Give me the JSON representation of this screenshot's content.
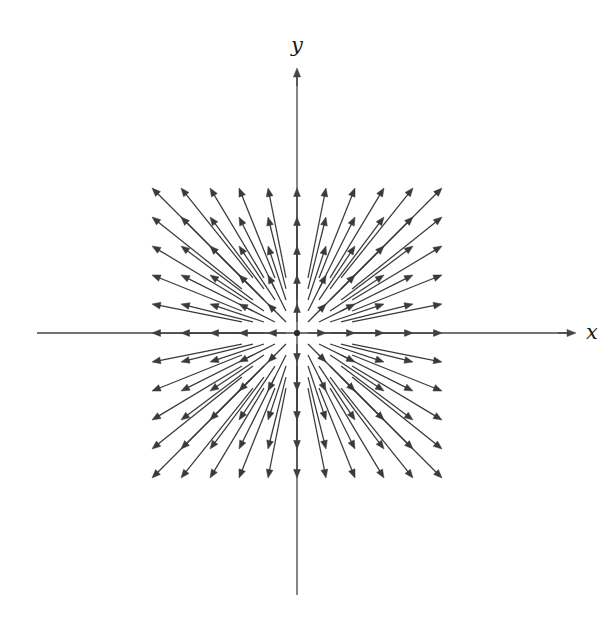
{
  "figure": {
    "width": 612,
    "height": 625,
    "background": "#ffffff",
    "title": ""
  },
  "axes": {
    "origin": {
      "x": 297,
      "y": 333
    },
    "color": "#444444",
    "line_width": 1.3,
    "x_axis": {
      "label": "x",
      "label_pos": {
        "x": 592,
        "y": 333
      },
      "start": {
        "x": 37,
        "y": 333
      },
      "end": {
        "x": 572,
        "y": 333
      },
      "arrow": "outward-right"
    },
    "y_axis": {
      "label": "y",
      "label_pos": {
        "x": 297,
        "y": 46
      },
      "start": {
        "x": 297,
        "y": 595
      },
      "end": {
        "x": 297,
        "y": 72
      },
      "arrow": "outward-up"
    }
  },
  "chart_data": {
    "type": "scatter",
    "plot_kind": "vector-field",
    "title": "",
    "xlabel": "x",
    "ylabel": "y",
    "grid": false,
    "legend": null,
    "xlim": [
      -5.8,
      5.8
    ],
    "ylim": [
      -5.8,
      5.8
    ],
    "field": {
      "name": "radial source field",
      "formula": "F(x, y) = ⟨x, y⟩",
      "direction": "radially outward from origin",
      "magnitude_rule": "proportional to distance from origin",
      "arrowhead_at": "lattice point",
      "tail_points_toward": "origin"
    },
    "lattice": {
      "i_min": -5,
      "i_max": 5,
      "j_min": -5,
      "j_max": 5,
      "count_x": 11,
      "count_y": 11,
      "spacing_px": 29,
      "total_arrows": 120,
      "origin_skipped": true
    },
    "arrow_style": {
      "color": "#3a3a3a",
      "line_width": 1.25,
      "head_length_px": 8.5,
      "head_half_width_px": 3.4,
      "scale_factor": 0.62
    },
    "sample_points": [
      {
        "x": 1,
        "y": 0,
        "u": 1,
        "v": 0
      },
      {
        "x": 5,
        "y": 0,
        "u": 5,
        "v": 0
      },
      {
        "x": -5,
        "y": 0,
        "u": -5,
        "v": 0
      },
      {
        "x": 0,
        "y": 5,
        "u": 0,
        "v": 5
      },
      {
        "x": 0,
        "y": -5,
        "u": 0,
        "v": -5
      },
      {
        "x": 5,
        "y": 5,
        "u": 5,
        "v": 5
      },
      {
        "x": -5,
        "y": 5,
        "u": -5,
        "v": 5
      },
      {
        "x": 5,
        "y": -5,
        "u": 5,
        "v": -5
      },
      {
        "x": -5,
        "y": -5,
        "u": -5,
        "v": -5
      },
      {
        "x": 3,
        "y": 2,
        "u": 3,
        "v": 2
      },
      {
        "x": -2,
        "y": 4,
        "u": -2,
        "v": 4
      },
      {
        "x": 4,
        "y": -3,
        "u": 4,
        "v": -3
      }
    ]
  }
}
